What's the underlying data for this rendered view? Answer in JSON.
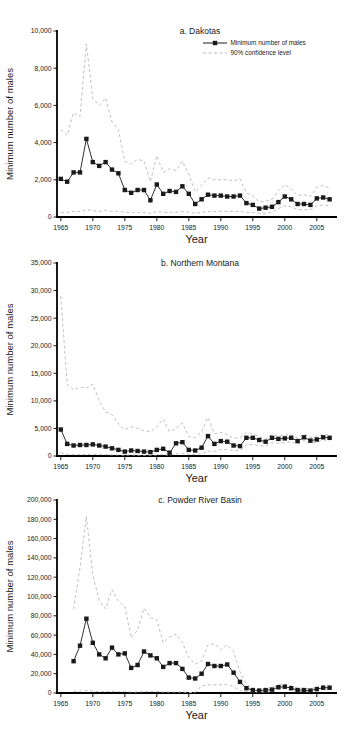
{
  "figure": {
    "xlabel": "Year",
    "ylabel": "Minimum number of males",
    "colors": {
      "series": "#1a1a1a",
      "confidence": "#b9b9b9",
      "axis": "#000000",
      "background": "#ffffff"
    },
    "legend": {
      "position": "top-right-panel-a",
      "series_label": "Minimum number of males",
      "confidence_label": "90% confidence level"
    }
  },
  "chart_data": [
    {
      "type": "line",
      "title": "a. Dakotas",
      "xlabel": "Year",
      "ylabel": "Minimum number of males",
      "xlim": [
        1964.4,
        2008
      ],
      "ylim": [
        0,
        10000
      ],
      "xticks": [
        1965,
        1970,
        1975,
        1980,
        1985,
        1990,
        1995,
        2000,
        2005
      ],
      "yticks": [
        0,
        2000,
        4000,
        6000,
        8000,
        10000
      ],
      "legend_visible": true,
      "x": [
        1965,
        1966,
        1967,
        1968,
        1969,
        1970,
        1971,
        1972,
        1973,
        1974,
        1975,
        1976,
        1977,
        1978,
        1979,
        1980,
        1981,
        1982,
        1983,
        1984,
        1985,
        1986,
        1987,
        1988,
        1989,
        1990,
        1991,
        1992,
        1993,
        1994,
        1995,
        1996,
        1997,
        1998,
        1999,
        2000,
        2001,
        2002,
        2003,
        2004,
        2005,
        2006,
        2007
      ],
      "series": [
        {
          "name": "Minimum number of males",
          "style": "marker-line",
          "values": [
            2050,
            1900,
            2400,
            2400,
            4200,
            2950,
            2750,
            2950,
            2550,
            2350,
            1450,
            1300,
            1450,
            1450,
            900,
            1750,
            1250,
            1400,
            1350,
            1650,
            1250,
            700,
            950,
            1200,
            1150,
            1150,
            1100,
            1100,
            1150,
            750,
            650,
            450,
            500,
            550,
            800,
            1100,
            950,
            700,
            700,
            650,
            1000,
            1050,
            950
          ]
        },
        {
          "name": "90% confidence level (upper)",
          "style": "dashed",
          "values": [
            4700,
            4400,
            5600,
            5400,
            9300,
            6400,
            6000,
            6400,
            5100,
            4700,
            3000,
            2850,
            3100,
            3000,
            1900,
            3300,
            2400,
            2600,
            2500,
            3000,
            2300,
            1350,
            1700,
            2100,
            2000,
            2000,
            2000,
            1950,
            2050,
            1300,
            1150,
            800,
            850,
            950,
            1400,
            1750,
            1500,
            1150,
            1200,
            1100,
            1600,
            1700,
            1550
          ]
        },
        {
          "name": "90% confidence level (lower)",
          "style": "dashed",
          "values": [
            250,
            250,
            300,
            300,
            400,
            350,
            300,
            350,
            300,
            300,
            250,
            250,
            250,
            250,
            200,
            300,
            250,
            250,
            250,
            300,
            250,
            200,
            250,
            300,
            300,
            300,
            300,
            300,
            300,
            250,
            250,
            200,
            200,
            250,
            450,
            600,
            550,
            400,
            400,
            400,
            600,
            650,
            600
          ]
        }
      ]
    },
    {
      "type": "line",
      "title": "b. Northern Montana",
      "xlabel": "Year",
      "ylabel": "Minimum number of males",
      "xlim": [
        1964.4,
        2008
      ],
      "ylim": [
        0,
        35000
      ],
      "xticks": [
        1965,
        1970,
        1975,
        1980,
        1985,
        1990,
        1995,
        2000,
        2005
      ],
      "yticks": [
        0,
        5000,
        10000,
        15000,
        20000,
        25000,
        30000,
        35000
      ],
      "legend_visible": false,
      "x": [
        1965,
        1966,
        1967,
        1968,
        1969,
        1970,
        1971,
        1972,
        1973,
        1974,
        1975,
        1976,
        1977,
        1978,
        1979,
        1980,
        1981,
        1982,
        1983,
        1984,
        1985,
        1986,
        1987,
        1988,
        1989,
        1990,
        1991,
        1992,
        1993,
        1994,
        1995,
        1996,
        1997,
        1998,
        1999,
        2000,
        2001,
        2002,
        2003,
        2004,
        2005,
        2006,
        2007
      ],
      "series": [
        {
          "name": "Minimum number of males",
          "style": "marker-line",
          "values": [
            4800,
            2200,
            1900,
            2000,
            2000,
            2100,
            1900,
            1700,
            1400,
            1100,
            800,
            1000,
            900,
            800,
            700,
            1100,
            1300,
            600,
            2300,
            2500,
            1100,
            1000,
            1500,
            3600,
            2200,
            2700,
            2600,
            1900,
            1800,
            3300,
            3300,
            2900,
            2600,
            3300,
            3100,
            3200,
            3300,
            2700,
            3400,
            2800,
            3000,
            3400,
            3300
          ]
        },
        {
          "name": "90% confidence level (upper)",
          "style": "dashed",
          "values": [
            29000,
            13000,
            12000,
            12500,
            12300,
            13000,
            10000,
            8000,
            7500,
            5800,
            4800,
            5300,
            5000,
            4600,
            4400,
            5300,
            6700,
            4400,
            5000,
            6000,
            3500,
            3300,
            4400,
            7000,
            4000,
            4300,
            3900,
            3200,
            3300,
            4200,
            4000,
            3500,
            3100,
            3900,
            3600,
            3700,
            3900,
            3200,
            4000,
            3300,
            3500,
            3900,
            3800
          ]
        },
        {
          "name": "90% confidence level (lower)",
          "style": "dashed",
          "values": [
            600,
            300,
            250,
            250,
            250,
            300,
            250,
            250,
            200,
            200,
            150,
            200,
            150,
            150,
            150,
            200,
            250,
            150,
            400,
            500,
            300,
            300,
            400,
            900,
            800,
            1200,
            1200,
            1000,
            1000,
            2000,
            2100,
            1900,
            1800,
            2400,
            2300,
            2400,
            2600,
            2200,
            2800,
            2300,
            2500,
            2900,
            2800
          ]
        }
      ]
    },
    {
      "type": "line",
      "title": "c. Powder River Basin",
      "xlabel": "Year",
      "ylabel": "Minimum number of males",
      "xlim": [
        1964.4,
        2008
      ],
      "ylim": [
        0,
        200000
      ],
      "xticks": [
        1965,
        1970,
        1975,
        1980,
        1985,
        1990,
        1995,
        2000,
        2005
      ],
      "yticks": [
        0,
        20000,
        40000,
        60000,
        80000,
        100000,
        120000,
        140000,
        160000,
        180000,
        200000
      ],
      "legend_visible": false,
      "x": [
        1967,
        1968,
        1969,
        1970,
        1971,
        1972,
        1973,
        1974,
        1975,
        1976,
        1977,
        1978,
        1979,
        1980,
        1981,
        1982,
        1983,
        1984,
        1985,
        1986,
        1987,
        1988,
        1989,
        1990,
        1991,
        1992,
        1993,
        1994,
        1995,
        1996,
        1997,
        1998,
        1999,
        2000,
        2001,
        2002,
        2003,
        2004,
        2005,
        2006,
        2007
      ],
      "series": [
        {
          "name": "Minimum number of males",
          "style": "marker-line",
          "values": [
            33000,
            49000,
            77000,
            52000,
            40000,
            36000,
            47000,
            40000,
            41000,
            26000,
            29000,
            43000,
            39000,
            36000,
            27000,
            31000,
            31000,
            25000,
            16000,
            15000,
            20000,
            30000,
            28000,
            28000,
            29500,
            21000,
            11500,
            5000,
            3000,
            2500,
            3000,
            3500,
            6000,
            6500,
            5000,
            3000,
            3000,
            2500,
            4000,
            5500,
            5500
          ]
        },
        {
          "name": "90% confidence level (upper)",
          "style": "dashed",
          "values": [
            87000,
            130000,
            183000,
            122000,
            96000,
            87000,
            107000,
            95000,
            90000,
            57000,
            65000,
            88000,
            78000,
            76000,
            52000,
            58000,
            61000,
            52000,
            37000,
            30000,
            33000,
            50000,
            51000,
            45000,
            50000,
            43000,
            22000,
            9000,
            5000,
            4000,
            5000,
            5500,
            8500,
            9000,
            7500,
            5000,
            5000,
            4000,
            6000,
            8000,
            8000
          ]
        },
        {
          "name": "90% confidence level (lower)",
          "style": "dashed",
          "values": [
            1500,
            2000,
            2500,
            2000,
            1500,
            1500,
            2000,
            1500,
            1500,
            1000,
            1000,
            1500,
            1500,
            1500,
            1000,
            1000,
            1000,
            1000,
            500,
            500,
            7500,
            8500,
            8500,
            8500,
            9000,
            6500,
            2500,
            1500,
            1000,
            1000,
            1000,
            1500,
            4000,
            4500,
            3000,
            1500,
            1500,
            1200,
            2500,
            3500,
            3500
          ]
        }
      ]
    }
  ]
}
